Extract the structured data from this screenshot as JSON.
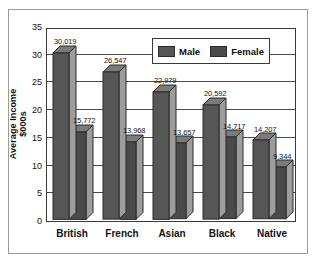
{
  "chart_data": {
    "type": "bar",
    "title": "",
    "subtitle": "",
    "xlabel": "",
    "ylabel": "Average Income $000s",
    "ylabel_line1": "Average Income",
    "ylabel_line2": "$000s",
    "ylim": [
      0,
      35
    ],
    "yticks": [
      0,
      5,
      10,
      15,
      20,
      25,
      30,
      35
    ],
    "ytick_labels": [
      "0",
      "5",
      "10",
      "15",
      "20",
      "25",
      "30",
      "35"
    ],
    "grid": true,
    "grid_axis": "y",
    "legend_position": "top-right-inside",
    "units_note": "values plotted in thousands of dollars",
    "categories": [
      "British",
      "French",
      "Asian",
      "Black",
      "Native"
    ],
    "series": [
      {
        "name": "Male",
        "color": "#565656",
        "values": [
          30.019,
          26.547,
          22.979,
          20.592,
          14.207
        ],
        "labels": [
          "30,019",
          "26,547",
          "22,979",
          "20,592",
          "14,207"
        ]
      },
      {
        "name": "Female",
        "color": "#4a4a4a",
        "values": [
          15.772,
          13.968,
          13.657,
          14.717,
          9.344
        ],
        "labels": [
          "15,772",
          "13,968",
          "13,657",
          "14,717",
          "9,344"
        ]
      }
    ]
  },
  "legend": {
    "items": [
      {
        "label": "Male",
        "color": "#565656"
      },
      {
        "label": "Female",
        "color": "#4a4a4a"
      }
    ]
  },
  "colors": {
    "bar_front_male": "#565656",
    "bar_front_female": "#4a4a4a",
    "bar_side": "#9d9d9d",
    "bar_top": "#7b7b7b",
    "axis": "#3a3a3a",
    "grid": "#4a4a4a",
    "frame": "#9a9a9a",
    "background": "#ffffff",
    "text": "#111111"
  }
}
